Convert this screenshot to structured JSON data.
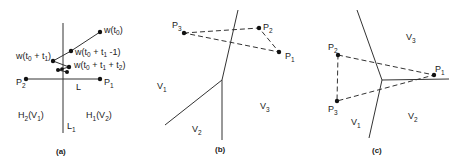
{
  "panels": [
    {
      "id": "a",
      "caption": "(a)",
      "labels": {
        "w_t0": "w(t",
        "w_t0_sub": "0",
        "w_t0_close": ")",
        "w_t0_t1_minus": "w(t",
        "w_t0_t1_minus_rest": " + t",
        "w_t0_t1_minus_end": " -1)",
        "w_t0_t1": "w(t",
        "w_t0_t1_rest": " + t",
        "w_t0_t1_end": ")",
        "w_t0_t1_t2": "w(t",
        "w_t0_t1_t2_rest": " + t",
        "w_t0_t1_t2_mid": " + t",
        "w_t0_t1_t2_end": ")",
        "sub0": "0",
        "sub1": "1",
        "sub2": "2",
        "P1": "P",
        "P2": "P",
        "L": "L",
        "L1": "L",
        "H2V1_H": "H",
        "H2V1_paren": "(V",
        "H2V1_close": ")",
        "H1V2_H": "H",
        "H1V2_paren": "(V",
        "H1V2_close": ")"
      }
    },
    {
      "id": "b",
      "caption": "(b)",
      "labels": {
        "P1": "P",
        "P2": "P",
        "P3": "P",
        "V1": "V",
        "V2": "V",
        "V3": "V",
        "sub1": "1",
        "sub2": "2",
        "sub3": "3"
      }
    },
    {
      "id": "c",
      "caption": "(c)",
      "labels": {
        "P1": "P",
        "P2": "P",
        "P3": "P",
        "V1": "V",
        "V2": "V",
        "V3": "V",
        "sub1": "1",
        "sub2": "2",
        "sub3": "3"
      }
    }
  ]
}
